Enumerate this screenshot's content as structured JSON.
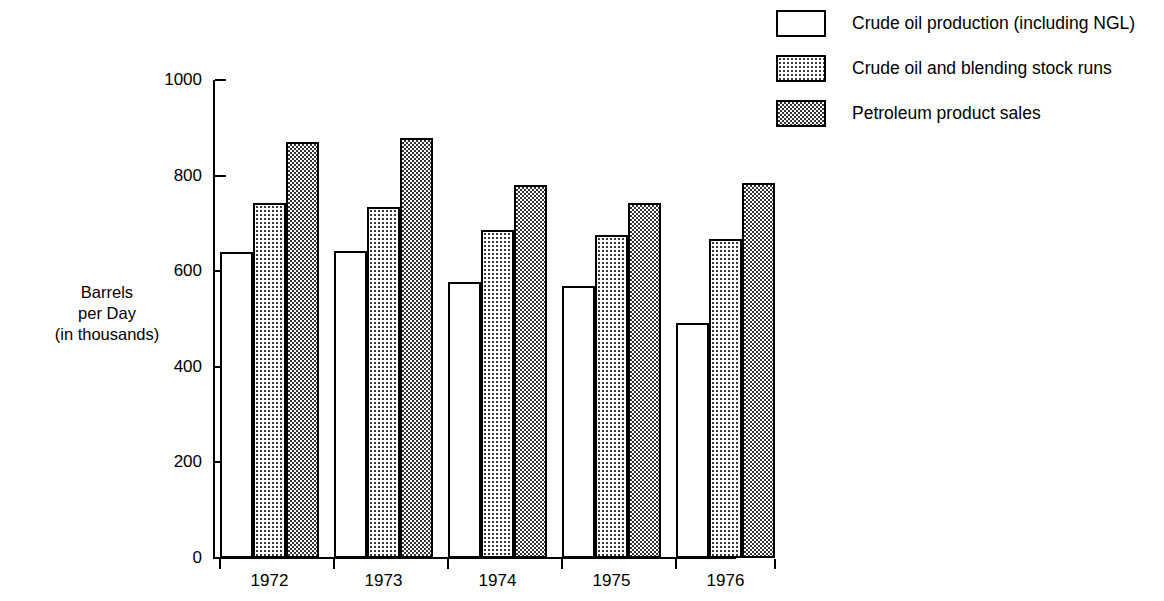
{
  "chart_data": {
    "type": "bar",
    "title": "",
    "xlabel": "",
    "ylabel": "Barrels per Day (in thousands)",
    "ylim": [
      0,
      1000
    ],
    "yticks": [
      0,
      200,
      400,
      600,
      800,
      1000
    ],
    "grid": false,
    "legend_position": "top-right",
    "categories": [
      "1972",
      "1973",
      "1974",
      "1975",
      "1976"
    ],
    "series": [
      {
        "name": "Crude oil production (including NGL)",
        "pattern": "plain",
        "values": [
          640,
          643,
          578,
          570,
          492
        ]
      },
      {
        "name": "Crude oil and blending stock runs",
        "pattern": "stipple",
        "values": [
          742,
          735,
          686,
          676,
          667
        ]
      },
      {
        "name": "Petroleum product sales",
        "pattern": "check",
        "values": [
          870,
          879,
          781,
          743,
          785
        ]
      }
    ]
  },
  "axis": {
    "y_title_line1": "Barrels",
    "y_title_line2": "per Day",
    "y_title_line3": "(in thousands)",
    "y_tick_labels": [
      "1000",
      "800",
      "600",
      "400",
      "200",
      "0"
    ],
    "x_tick_labels": [
      "1972",
      "1973",
      "1974",
      "1975",
      "1976"
    ]
  },
  "legend": {
    "items": [
      {
        "label": "Crude oil production (including NGL)",
        "pattern": "plain"
      },
      {
        "label": "Crude oil and blending stock runs",
        "pattern": "stipple"
      },
      {
        "label": "Petroleum product sales",
        "pattern": "check"
      }
    ]
  },
  "colors": {
    "ink": "#000000",
    "background": "#ffffff",
    "pattern_dark": "#333333"
  }
}
